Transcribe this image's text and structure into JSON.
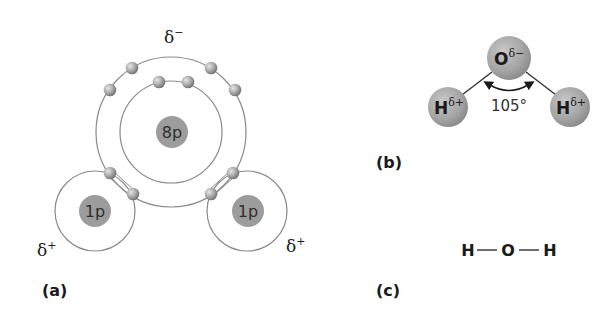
{
  "figure": {
    "panel_a": {
      "label": "(a)",
      "oxygen_nucleus": "8p",
      "hydrogen_nuclei": [
        "1p",
        "1p"
      ],
      "charge_top": "δ",
      "charge_top_sign": "−",
      "charge_left": "δ",
      "charge_left_sign": "+",
      "charge_right": "δ",
      "charge_right_sign": "+",
      "electron_count": 10
    },
    "panel_b": {
      "label": "(b)",
      "oxygen": "O",
      "oxygen_charge": "δ−",
      "hydrogen_left": "H",
      "hydrogen_left_charge": "δ+",
      "hydrogen_right": "H",
      "hydrogen_right_charge": "δ+",
      "bond_angle": "105°"
    },
    "panel_c": {
      "label": "(c)",
      "atoms": [
        "H",
        "O",
        "H"
      ]
    }
  },
  "colors": {
    "orbit": "#8a8a8a",
    "nucleus": "#9c9c9c",
    "sphere": "#a6a6a6",
    "text": "#1a1a1a"
  }
}
